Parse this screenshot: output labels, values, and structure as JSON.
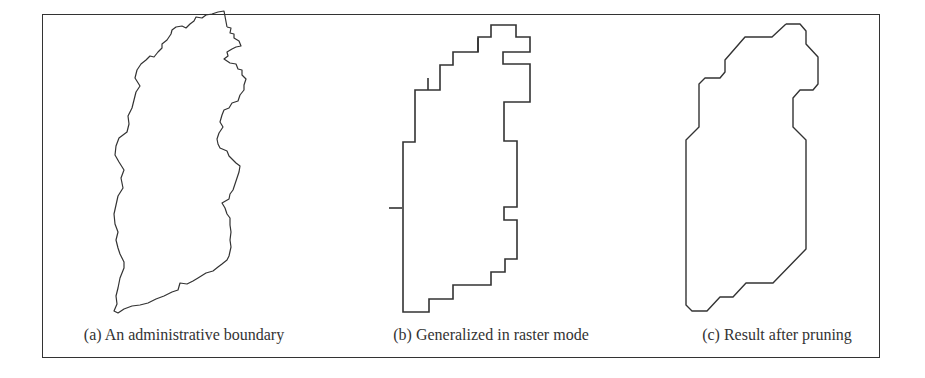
{
  "figure": {
    "panels": [
      {
        "id": "a",
        "caption": "(a) An administrative boundary",
        "caption_center_x": 184,
        "stroke": "#333333",
        "points": "227,27 231,28 230,33 234,34 234,38 239,41 241,46 236,47 232,49 227,52 228,56 224,59 230,63 236,64 238,69 242,70 242,75 246,79 244,85 244,90 240,95 238,101 232,103 229,108 224,110 222,115 220,122 223,127 219,133 217,139 218,144 220,148 227,151 229,156 233,160 236,163 240,166 239,172 237,178 235,184 233,190 230,194 229,199 222,203 225,208 227,214 230,218 230,225 231,232 230,240 231,247 229,256 227,260 222,264 218,267 213,271 206,273 198,278 193,281 187,284 180,283 178,290 172,292 164,296 156,299 148,303 140,305 132,306 124,309 118,313 114,311 117,304 116,296 118,288 120,278 124,268 124,262 120,254 118,248 116,240 118,232 115,224 114,214 116,205 118,196 123,188 121,178 124,170 119,162 115,155 116,146 119,138 127,132 129,124 128,116 132,108 134,100 136,92 140,86 135,78 137,70 141,64 146,60 150,56 154,57 158,52 162,48 162,44 167,40 171,34 172,30 176,27 182,26 186,28 190,24 194,21 196,17 202,18 206,15 212,14 218,12 224,11 227,27"
      },
      {
        "id": "b",
        "caption": "(b) Generalized in raster mode",
        "caption_center_x": 491,
        "stroke": "#333333",
        "points": "503,25 516,25 516,37 530,37 530,52 503,52 503,64 530,64 530,102 504,102 504,141 517,141 517,207 504,207 504,220 517,220 517,259 505,259 505,272 491,272 491,285 453,285 453,299 429,299 429,312 403,312 403,142 415,142 415,90 440,90 440,65 453,65 453,52 478,52 478,37 491,37 491,25 503,25",
        "spurs": [
          [
            402,
            208,
            389,
            208
          ],
          [
            428,
            90,
            428,
            78
          ],
          [
            478,
            52,
            478,
            38
          ]
        ]
      },
      {
        "id": "c",
        "caption": "(c) Result after pruning",
        "caption_center_x": 777,
        "stroke": "#333333",
        "points": "786,24 800,24 806,31 806,44 818,57 818,84 813,90 800,90 793,98 793,127 806,140 806,249 773,283 746,283 733,297 720,297 707,311 692,311 686,305 686,140 699,127 699,84 705,78 720,78 725,72 725,60 745,37 772,37 786,24"
      }
    ]
  }
}
